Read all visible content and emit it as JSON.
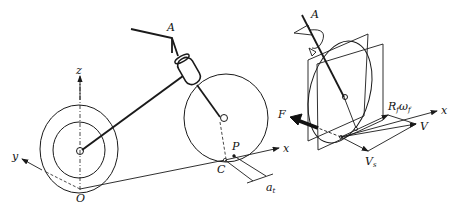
{
  "diagram": {
    "left": {
      "title": "Motorcycle geometry with coordinate frame",
      "labels": {
        "steering_point": "A",
        "z_axis": "z",
        "y_axis": "y",
        "origin": "O",
        "x_axis": "x",
        "contact_point": "C",
        "trail_point": "P",
        "trail": "a",
        "trail_sub": "t"
      }
    },
    "right": {
      "title": "Front wheel contact kinematics",
      "labels": {
        "steering_axis": "A",
        "force": "F",
        "spin_velocity": "R",
        "spin_sub1": "f",
        "omega": "ω",
        "spin_sub2": "f",
        "x_axis": "x",
        "velocity": "V",
        "slip_velocity": "V",
        "slip_sub": "s"
      }
    },
    "colors": {
      "stroke": "#1a1a1a",
      "background": "#ffffff"
    }
  }
}
